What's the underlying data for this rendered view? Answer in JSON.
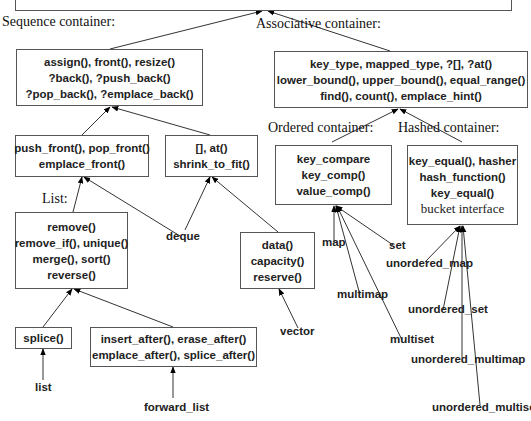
{
  "diagram": {
    "type": "class-hierarchy",
    "top_box": {
      "lines": []
    },
    "headings": {
      "sequence": "Sequence container:",
      "associative": "Associative container:",
      "ordered": "Ordered container:",
      "hashed": "Hashed container:",
      "list": "List:"
    },
    "boxes": {
      "sequence": {
        "lines": [
          "assign(), front(), resize()",
          "?back(), ?push_back()",
          "?pop_back(), ?emplace_back()"
        ]
      },
      "associative": {
        "lines": [
          "key_type, mapped_type, ?[], ?at()",
          "lower_bound(), upper_bound(), equal_range()",
          "find(), count(), emplace_hint()"
        ]
      },
      "front_ops": {
        "lines": [
          "push_front(), pop_front()",
          "emplace_front()"
        ]
      },
      "random_access": {
        "lines": [
          "[], at()",
          "shrink_to_fit()"
        ]
      },
      "ordered": {
        "lines": [
          "key_compare",
          "key_comp()",
          "value_comp()"
        ]
      },
      "hashed": {
        "lines": [
          "key_equal(), hasher",
          "hash_function()",
          "key_equal()",
          "bucket interface"
        ]
      },
      "list_ops": {
        "lines": [
          "remove()",
          "remove_if(), unique()",
          "merge(), sort()",
          "reverse()"
        ]
      },
      "contiguous": {
        "lines": [
          "data()",
          "capacity()",
          "reserve()"
        ]
      },
      "splice": {
        "lines": [
          "splice()"
        ]
      },
      "forward_list_ops": {
        "lines": [
          "insert_after(), erase_after()",
          "emplace_after(), splice_after()"
        ]
      }
    },
    "leaves": {
      "deque": "deque",
      "vector": "vector",
      "list": "list",
      "forward_list": "forward_list",
      "map": "map",
      "set": "set",
      "multimap": "multimap",
      "multiset": "multiset",
      "unordered_map": "unordered_map",
      "unordered_set": "unordered_set",
      "unordered_multimap": "unordered_multimap",
      "unordered_multiset": "unordered_multiset"
    },
    "edges": [
      {
        "from": "sequence",
        "to": "top_box"
      },
      {
        "from": "associative",
        "to": "top_box"
      },
      {
        "from": "front_ops",
        "to": "sequence"
      },
      {
        "from": "random_access",
        "to": "sequence"
      },
      {
        "from": "ordered",
        "to": "associative"
      },
      {
        "from": "hashed",
        "to": "associative"
      },
      {
        "from": "list_ops",
        "to": "front_ops"
      },
      {
        "from": "deque",
        "to": "front_ops"
      },
      {
        "from": "deque",
        "to": "random_access"
      },
      {
        "from": "contiguous",
        "to": "random_access"
      },
      {
        "from": "splice",
        "to": "list_ops"
      },
      {
        "from": "forward_list_ops",
        "to": "list_ops"
      },
      {
        "from": "list",
        "to": "splice"
      },
      {
        "from": "forward_list",
        "to": "forward_list_ops"
      },
      {
        "from": "vector",
        "to": "contiguous"
      },
      {
        "from": "map",
        "to": "ordered"
      },
      {
        "from": "set",
        "to": "ordered"
      },
      {
        "from": "multimap",
        "to": "ordered"
      },
      {
        "from": "multiset",
        "to": "ordered"
      },
      {
        "from": "unordered_map",
        "to": "hashed"
      },
      {
        "from": "unordered_set",
        "to": "hashed"
      },
      {
        "from": "unordered_multimap",
        "to": "hashed"
      },
      {
        "from": "unordered_multiset",
        "to": "hashed"
      }
    ]
  }
}
